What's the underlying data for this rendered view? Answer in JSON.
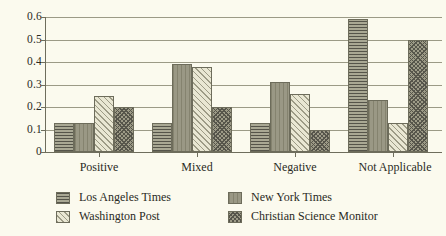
{
  "background_color": "#fbfaee",
  "axis_color": "#6e6d5c",
  "gridline_color": "#9b9a86",
  "text_color": "#2a2a24",
  "y_axis": {
    "ticks": [
      "0.6",
      "0.5",
      "0.4",
      "0.3",
      "0.2",
      "0.1",
      "0"
    ]
  },
  "legend": {
    "entries": [
      {
        "label": "Los Angeles Times",
        "pattern": "horizontal-lines-dark"
      },
      {
        "label": "New York Times",
        "pattern": "solid-grey"
      },
      {
        "label": "Washington Post",
        "pattern": "diagonal-hatch-light"
      },
      {
        "label": "Christian Science Monitor",
        "pattern": "cross-hatch-dark"
      }
    ]
  },
  "chart_data": {
    "type": "bar",
    "title": "",
    "xlabel": "",
    "ylabel": "",
    "ylim": [
      0,
      0.6
    ],
    "yticks": [
      0,
      0.1,
      0.2,
      0.3,
      0.4,
      0.5,
      0.6
    ],
    "grid": true,
    "legend_position": "bottom",
    "categories": [
      "Positive",
      "Mixed",
      "Negative",
      "Not Applicable"
    ],
    "series": [
      {
        "name": "Los Angeles Times",
        "values": [
          0.13,
          0.13,
          0.13,
          0.59
        ]
      },
      {
        "name": "New York Times",
        "values": [
          0.13,
          0.39,
          0.31,
          0.23
        ]
      },
      {
        "name": "Washington Post",
        "values": [
          0.25,
          0.38,
          0.26,
          0.13
        ]
      },
      {
        "name": "Christian Science Monitor",
        "values": [
          0.2,
          0.2,
          0.1,
          0.5
        ]
      }
    ]
  }
}
